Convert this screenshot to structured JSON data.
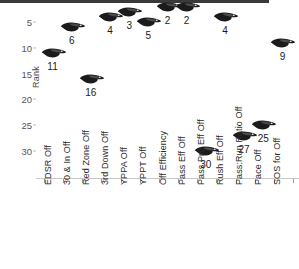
{
  "chart_data": {
    "type": "scatter",
    "title": "",
    "xlabel": "",
    "ylabel": "Rank",
    "ylim": [
      1,
      32
    ],
    "y_inverted": true,
    "grid": false,
    "legend": "none",
    "marker_icon": "raven-head-logo",
    "y_ticks": [
      5,
      10,
      15,
      20,
      25,
      30
    ],
    "categories": [
      "EDSR Off",
      "30 & In Off",
      "Red Zone Off",
      "3rd Down Off",
      "YPPA Off",
      "YPPT Off",
      "Off Efficiency",
      "Pass Eff Off",
      "Pass Pro Eff Off",
      "Rush Eff Off",
      "Pass:Run Ratio Off",
      "Pace Off",
      "SOS for Off"
    ],
    "values": [
      11,
      6,
      16,
      4,
      3,
      5,
      2,
      2,
      30,
      4,
      27,
      25,
      9
    ],
    "point_labels": [
      "11",
      "6",
      "16",
      "4",
      "3",
      "5",
      "2",
      "2",
      "30",
      "4",
      "27",
      "25",
      "9"
    ]
  },
  "colors": {
    "marker": "#1b1b1b",
    "axis": "#c8c8c8",
    "tick_text": "#555555",
    "label_text": "#2b2b2b",
    "background": "#ffffff",
    "top_band": "#3a3a3a"
  }
}
